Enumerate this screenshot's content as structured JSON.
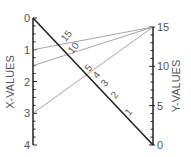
{
  "chart_data": {
    "type": "nomogram",
    "title": "",
    "left_axis": {
      "label": "X-VALUES",
      "range": [
        0,
        4
      ],
      "major_ticks": [
        0,
        1,
        2,
        3,
        4
      ],
      "tick_labels": [
        "0",
        "1",
        "2",
        "3",
        "4"
      ],
      "minor_step": 0.25
    },
    "right_axis": {
      "label": "Y-VALUES",
      "range": [
        0,
        15
      ],
      "major_ticks": [
        0,
        5,
        10,
        15
      ],
      "tick_labels": [
        "0",
        "5",
        "10",
        "15"
      ],
      "minor_step": 1
    },
    "diagonal_scale": {
      "tick_labels": [
        "1",
        "2",
        "3",
        "4",
        "5",
        "10",
        "15"
      ],
      "tick_values": [
        1,
        2,
        3,
        4,
        5,
        10,
        15
      ]
    },
    "isopleths": [
      {
        "x": 1,
        "y": 15
      },
      {
        "x": 1.5,
        "y": 15
      },
      {
        "x": 3,
        "y": 15
      }
    ]
  },
  "colors": {
    "axis": "#222222",
    "isopleth": "#9a9a9a",
    "label": "#555555"
  }
}
